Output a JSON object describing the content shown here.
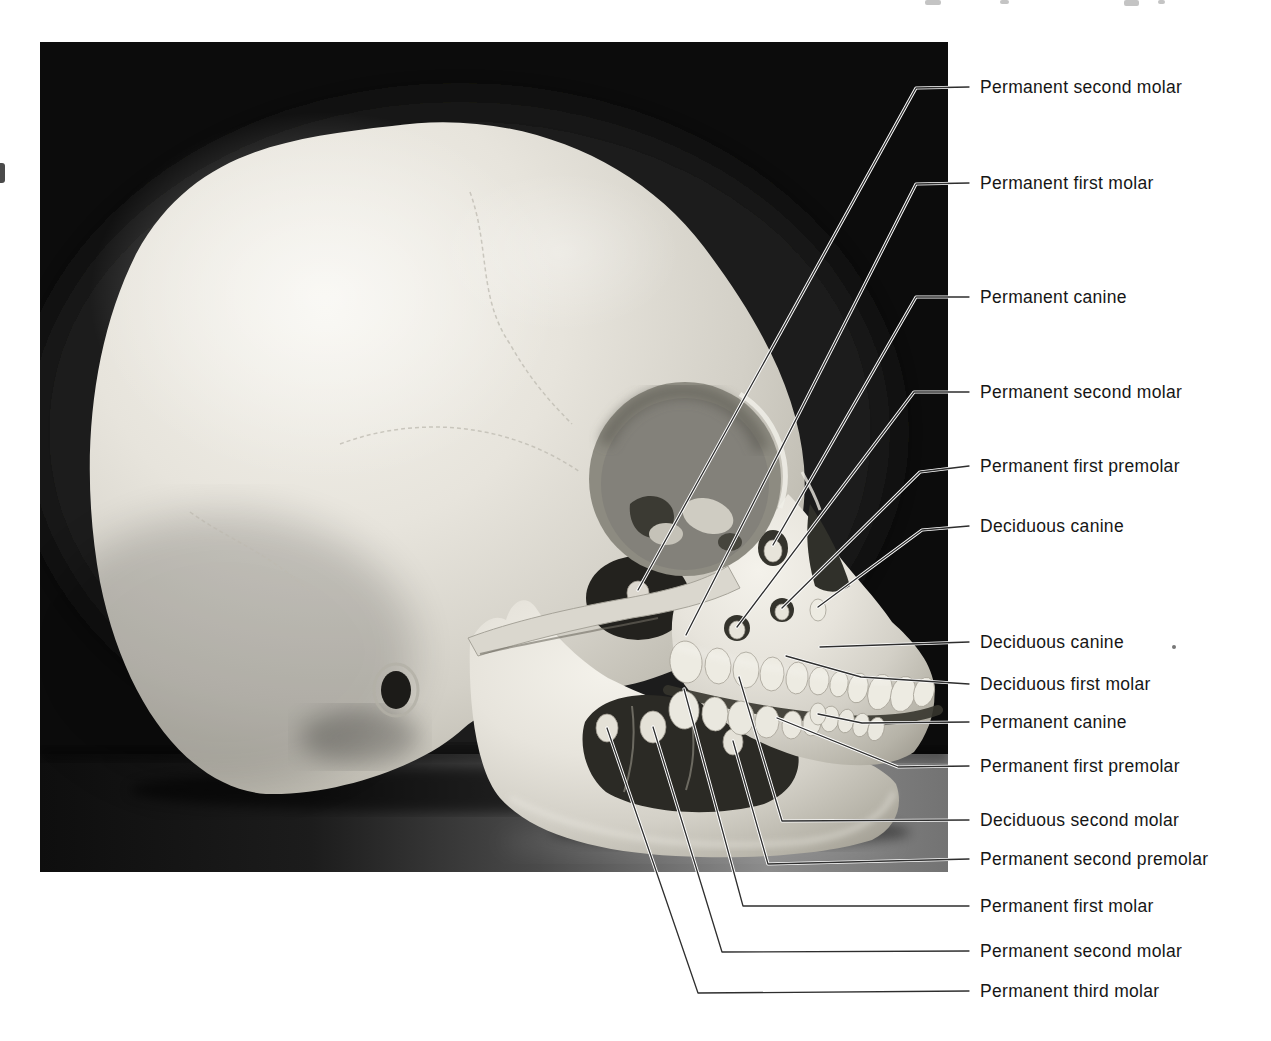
{
  "page": {
    "background": "#ffffff",
    "width": 1271,
    "height": 1041
  },
  "figure": {
    "photo": {
      "x": 40,
      "y": 42,
      "width": 908,
      "height": 830,
      "background": "#0c0c0c"
    },
    "label_style": {
      "text_color": "#161616",
      "line_color": "#2e2e2e",
      "line_casing": "#ffffff",
      "font_size_px": 17.5
    },
    "labels": [
      {
        "text": "Permanent second molar",
        "x": 980,
        "y": 87,
        "line": [
          [
            969,
            87
          ],
          [
            916,
            88
          ],
          [
            638,
            590
          ]
        ]
      },
      {
        "text": "Permanent first molar",
        "x": 980,
        "y": 183,
        "line": [
          [
            969,
            183
          ],
          [
            916,
            184
          ],
          [
            686,
            635
          ]
        ]
      },
      {
        "text": "Permanent canine",
        "x": 980,
        "y": 297,
        "line": [
          [
            969,
            297
          ],
          [
            916,
            297
          ],
          [
            773,
            545
          ]
        ]
      },
      {
        "text": "Permanent second molar",
        "x": 980,
        "y": 392,
        "line": [
          [
            969,
            392
          ],
          [
            914,
            392
          ],
          [
            737,
            627
          ]
        ]
      },
      {
        "text": "Permanent first premolar",
        "x": 980,
        "y": 466,
        "line": [
          [
            969,
            466
          ],
          [
            920,
            472
          ],
          [
            782,
            608
          ]
        ]
      },
      {
        "text": "Deciduous canine",
        "x": 980,
        "y": 526,
        "line": [
          [
            969,
            526
          ],
          [
            922,
            530
          ],
          [
            818,
            607
          ]
        ]
      },
      {
        "text": "Deciduous canine",
        "x": 980,
        "y": 642,
        "line": [
          [
            969,
            642
          ],
          [
            850,
            646
          ],
          [
            820,
            647
          ]
        ]
      },
      {
        "text": "Deciduous first molar",
        "x": 980,
        "y": 684,
        "line": [
          [
            969,
            684
          ],
          [
            861,
            677
          ],
          [
            786,
            656
          ]
        ]
      },
      {
        "text": "Permanent canine",
        "x": 980,
        "y": 722,
        "line": [
          [
            969,
            722
          ],
          [
            862,
            723
          ],
          [
            818,
            714
          ]
        ]
      },
      {
        "text": "Permanent first premolar",
        "x": 980,
        "y": 766,
        "line": [
          [
            969,
            766
          ],
          [
            898,
            767
          ],
          [
            777,
            718
          ]
        ]
      },
      {
        "text": "Deciduous second molar",
        "x": 980,
        "y": 820,
        "line": [
          [
            969,
            820
          ],
          [
            782,
            821
          ],
          [
            739,
            677
          ]
        ]
      },
      {
        "text": "Permanent second premolar",
        "x": 980,
        "y": 859,
        "line": [
          [
            969,
            859
          ],
          [
            768,
            864
          ],
          [
            733,
            741
          ]
        ]
      },
      {
        "text": "Permanent first molar",
        "x": 980,
        "y": 906,
        "line": [
          [
            969,
            906
          ],
          [
            743,
            906
          ],
          [
            684,
            689
          ]
        ]
      },
      {
        "text": "Permanent second molar",
        "x": 980,
        "y": 951,
        "line": [
          [
            969,
            951
          ],
          [
            722,
            952
          ],
          [
            653,
            727
          ]
        ]
      },
      {
        "text": "Permanent third molar",
        "x": 980,
        "y": 991,
        "line": [
          [
            969,
            991
          ],
          [
            698,
            993
          ],
          [
            607,
            728
          ]
        ]
      }
    ],
    "artifacts": {
      "top_edge_fragments": [
        {
          "x": 925,
          "y": 0,
          "w": 16,
          "h": 5
        },
        {
          "x": 1000,
          "y": 0,
          "w": 9,
          "h": 4
        },
        {
          "x": 1124,
          "y": 0,
          "w": 15,
          "h": 6
        },
        {
          "x": 1158,
          "y": 0,
          "w": 7,
          "h": 4
        }
      ],
      "left_edge_mark": {
        "x": 0,
        "y": 163,
        "w": 5,
        "h": 20
      },
      "stray_dot": {
        "x": 1174,
        "y": 647,
        "r": 2
      }
    }
  },
  "skull_colors": {
    "photo_background": "#0c0c0c",
    "bone_light": "#f3f1ea",
    "bone_mid": "#d7d4cb",
    "bone_shadow": "#9a968b",
    "cavity_dark": "#2b2a25",
    "teeth": "#edebe2",
    "table_light": "#8c8c8c",
    "table_dark": "#121212"
  }
}
